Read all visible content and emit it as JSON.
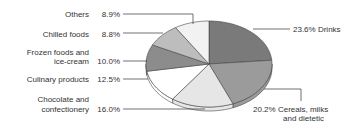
{
  "chart_data": {
    "type": "pie",
    "title": "",
    "unit": "%",
    "start": "12 o'clock",
    "direction": "clockwise",
    "slices": [
      {
        "label": "Drinks",
        "value": 23.6,
        "value_text": "23.6%",
        "label_lines": [
          "23.6% Drinks"
        ],
        "side": "right",
        "color": "#7a7a7a"
      },
      {
        "label": "Cereals, milks and dietetic",
        "value": 20.2,
        "value_text": "20.2%",
        "label_lines": [
          "20.2% Cereals, milks",
          "and dietetic"
        ],
        "side": "right",
        "color": "#9b9b9b"
      },
      {
        "label": "Chocolate and confectionery",
        "value": 16.0,
        "value_text": "16.0%",
        "label_lines": [
          "Chocolate and",
          "confectionery"
        ],
        "side": "left",
        "color": "#e6e6e6"
      },
      {
        "label": "Culinary products",
        "value": 12.5,
        "value_text": "12.5%",
        "label_lines": [
          "Culinary products"
        ],
        "side": "left",
        "color": "#ffffff"
      },
      {
        "label": "Frozen foods and ice-cream",
        "value": 10.0,
        "value_text": "10.0%",
        "label_lines": [
          "Frozen foods and",
          "ice-cream"
        ],
        "side": "left",
        "color": "#8c8c8c"
      },
      {
        "label": "Chilled foods",
        "value": 8.8,
        "value_text": "8.8%",
        "label_lines": [
          "Chilled foods"
        ],
        "side": "left",
        "color": "#bdbdbd"
      },
      {
        "label": "Others",
        "value": 8.9,
        "value_text": "8.9%",
        "label_lines": [
          "Others"
        ],
        "side": "left",
        "color": "#f2f2f2"
      }
    ],
    "legend": "none (leader-line labels)"
  }
}
